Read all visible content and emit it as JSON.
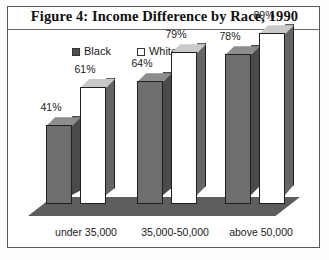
{
  "figure": {
    "title": "Figure 4: Income Difference by Race, 1990"
  },
  "legend": {
    "entries": [
      {
        "label": "Black",
        "swatch": "filled-dark-square",
        "color": "#4e4e4e"
      },
      {
        "label": "White",
        "swatch": "outlined-white-square",
        "color": "#ffffff"
      }
    ]
  },
  "chart_data": {
    "type": "bar",
    "title": "Figure 4: Income Difference by Race, 1990",
    "xlabel": "",
    "ylabel": "",
    "ylim": [
      0,
      100
    ],
    "grid": false,
    "legend_position": "top-center",
    "style": "3d-clustered-column",
    "categories": [
      "under 35,000",
      "35,000-50,000",
      "above 50,000"
    ],
    "series": [
      {
        "name": "Black",
        "values": [
          41,
          64,
          78
        ],
        "labels": [
          "41%",
          "64%",
          "78%"
        ],
        "color": "#6e6e6e"
      },
      {
        "name": "White",
        "values": [
          61,
          79,
          89
        ],
        "labels": [
          "61%",
          "79%",
          "89%"
        ],
        "color": "#ffffff"
      }
    ]
  }
}
